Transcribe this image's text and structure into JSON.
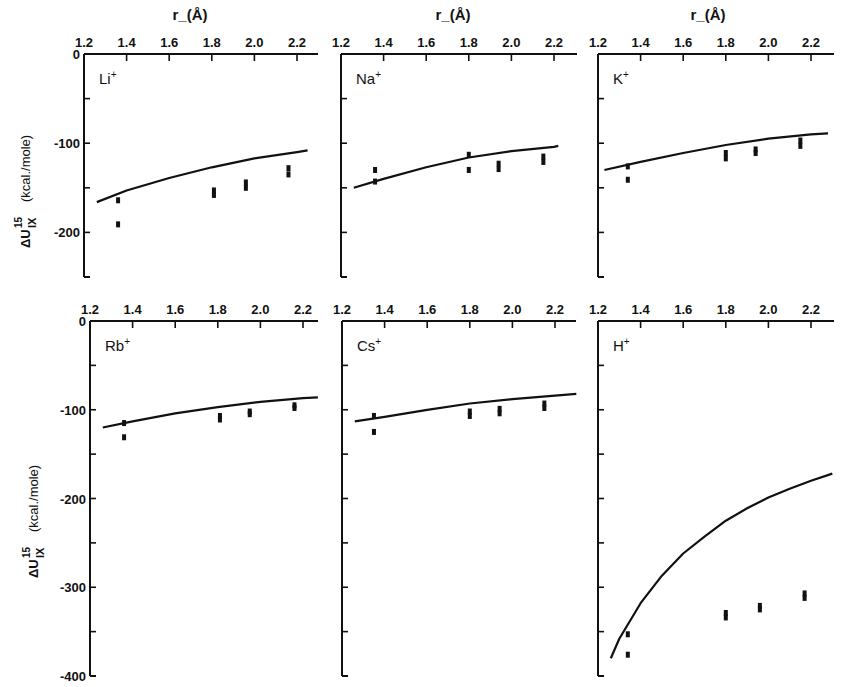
{
  "figure": {
    "x_axis_title": "r_(Å)",
    "y_axis_title_main": "ΔU",
    "y_axis_title_sup": "15",
    "y_axis_title_sub": "IX",
    "y_axis_units": "(kcal./mole)",
    "line_color": "#111111",
    "background": "#ffffff"
  },
  "chart_data": [
    {
      "type": "line",
      "panel": "Li+",
      "ion_label": "Li",
      "xlabel": "r_(Å)",
      "ylabel": "ΔU15 IX (kcal./mole)",
      "x_ticks": [
        "1.2",
        "1.4",
        "1.6",
        "1.8",
        "2.0",
        "2.2"
      ],
      "y_ticks": [
        "0",
        "-100",
        "-200"
      ],
      "xlim": [
        1.2,
        2.3
      ],
      "ylim": [
        -250,
        0
      ],
      "series": [
        {
          "name": "calculated",
          "style": "line",
          "x": [
            1.26,
            1.4,
            1.6,
            1.8,
            2.0,
            2.2,
            2.25
          ],
          "y": [
            -166,
            -153,
            -139,
            -127,
            -117,
            -110,
            -108
          ]
        },
        {
          "name": "experimental",
          "style": "markers",
          "x": [
            1.36,
            1.36,
            1.81,
            1.81,
            1.96,
            1.96,
            2.16,
            2.16
          ],
          "y": [
            -164,
            -191,
            -153,
            -158,
            -144,
            -150,
            -128,
            -135
          ]
        }
      ]
    },
    {
      "type": "line",
      "panel": "Na+",
      "ion_label": "Na",
      "xlabel": "r_(Å)",
      "x_ticks": [
        "1.2",
        "1.4",
        "1.6",
        "1.8",
        "2.0",
        "2.2"
      ],
      "y_ticks": [
        "0",
        "-100",
        "-200"
      ],
      "xlim": [
        1.2,
        2.3
      ],
      "ylim": [
        -250,
        0
      ],
      "series": [
        {
          "name": "calculated",
          "style": "line",
          "x": [
            1.26,
            1.4,
            1.6,
            1.8,
            2.0,
            2.2,
            2.22
          ],
          "y": [
            -150,
            -140,
            -127,
            -116,
            -109,
            -104,
            -103
          ]
        },
        {
          "name": "experimental",
          "style": "markers",
          "x": [
            1.36,
            1.36,
            1.8,
            1.8,
            1.94,
            1.94,
            2.15,
            2.15
          ],
          "y": [
            -130,
            -143,
            -113,
            -130,
            -123,
            -129,
            -115,
            -121
          ]
        }
      ]
    },
    {
      "type": "line",
      "panel": "K+",
      "ion_label": "K",
      "xlabel": "r_(Å)",
      "x_ticks": [
        "1.2",
        "1.4",
        "1.6",
        "1.8",
        "2.0",
        "2.2"
      ],
      "y_ticks": [
        "0",
        "-100",
        "-200"
      ],
      "xlim": [
        1.2,
        2.3
      ],
      "ylim": [
        -250,
        0
      ],
      "series": [
        {
          "name": "calculated",
          "style": "line",
          "x": [
            1.23,
            1.4,
            1.6,
            1.8,
            2.0,
            2.2,
            2.28
          ],
          "y": [
            -130,
            -121,
            -111,
            -102,
            -95,
            -90,
            -89
          ]
        },
        {
          "name": "experimental",
          "style": "markers",
          "x": [
            1.34,
            1.34,
            1.8,
            1.8,
            1.94,
            1.94,
            2.15,
            2.15
          ],
          "y": [
            -126,
            -141,
            -111,
            -117,
            -107,
            -111,
            -97,
            -103
          ]
        }
      ]
    },
    {
      "type": "line",
      "panel": "Rb+",
      "ion_label": "Rb",
      "xlabel": "",
      "ylabel": "ΔU15 IX (kcal./mole)",
      "x_ticks": [
        "1.2",
        "1.4",
        "1.6",
        "1.8",
        "2.0",
        "2.2"
      ],
      "y_ticks": [
        "0",
        "-100",
        "-200",
        "-300",
        "-400"
      ],
      "xlim": [
        1.2,
        2.3
      ],
      "ylim": [
        -400,
        0
      ],
      "series": [
        {
          "name": "calculated",
          "style": "line",
          "x": [
            1.26,
            1.4,
            1.6,
            1.8,
            2.0,
            2.2,
            2.27
          ],
          "y": [
            -120,
            -113,
            -104,
            -97,
            -91,
            -87,
            -86
          ]
        },
        {
          "name": "experimental",
          "style": "markers",
          "x": [
            1.36,
            1.36,
            1.81,
            1.81,
            1.95,
            1.95,
            2.16,
            2.16
          ],
          "y": [
            -115,
            -131,
            -107,
            -111,
            -102,
            -105,
            -95,
            -98
          ]
        }
      ]
    },
    {
      "type": "line",
      "panel": "Cs+",
      "ion_label": "Cs",
      "xlabel": "",
      "x_ticks": [
        "1.2",
        "1.4",
        "1.6",
        "1.8",
        "2.0",
        "2.2"
      ],
      "y_ticks": [
        "0",
        "-100",
        "-200",
        "-300",
        "-400"
      ],
      "xlim": [
        1.2,
        2.3
      ],
      "ylim": [
        -400,
        0
      ],
      "series": [
        {
          "name": "calculated",
          "style": "line",
          "x": [
            1.26,
            1.4,
            1.6,
            1.8,
            2.0,
            2.2,
            2.3
          ],
          "y": [
            -113,
            -108,
            -100,
            -93,
            -88,
            -84,
            -82
          ]
        },
        {
          "name": "experimental",
          "style": "markers",
          "x": [
            1.35,
            1.35,
            1.8,
            1.8,
            1.94,
            1.94,
            2.15,
            2.15
          ],
          "y": [
            -107,
            -125,
            -102,
            -107,
            -99,
            -104,
            -93,
            -98
          ]
        }
      ]
    },
    {
      "type": "line",
      "panel": "H+",
      "ion_label": "H",
      "xlabel": "",
      "x_ticks": [
        "1.2",
        "1.4",
        "1.6",
        "1.8",
        "2.0",
        "2.2"
      ],
      "y_ticks": [
        "0",
        "-100",
        "-200",
        "-300",
        "-400"
      ],
      "xlim": [
        1.2,
        2.3
      ],
      "ylim": [
        -400,
        0
      ],
      "series": [
        {
          "name": "calculated",
          "style": "line",
          "x": [
            1.26,
            1.3,
            1.4,
            1.5,
            1.6,
            1.7,
            1.8,
            1.9,
            2.0,
            2.1,
            2.2,
            2.3
          ],
          "y": [
            -380,
            -358,
            -318,
            -287,
            -262,
            -243,
            -225,
            -211,
            -199,
            -189,
            -180,
            -172
          ]
        },
        {
          "name": "experimental",
          "style": "markers",
          "x": [
            1.34,
            1.34,
            1.8,
            1.8,
            1.96,
            1.96,
            2.17,
            2.17
          ],
          "y": [
            -353,
            -376,
            -329,
            -334,
            -321,
            -325,
            -307,
            -312
          ]
        }
      ]
    }
  ]
}
